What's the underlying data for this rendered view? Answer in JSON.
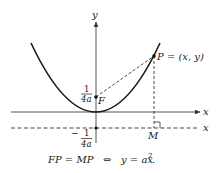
{
  "diagram": {
    "axes": {
      "x_label": "x",
      "y_label": "y",
      "directrix_label": "x"
    },
    "points": {
      "focus": {
        "name": "F",
        "y_value_num": "1",
        "y_value_den": "4a"
      },
      "point": {
        "label": "P = (x, y)"
      },
      "foot": {
        "name": "M"
      },
      "directrix_value": {
        "sign": "−",
        "num": "1",
        "den": "4a"
      }
    },
    "equation": {
      "left": "FP = MP",
      "iff": "⇔",
      "right_base": "y = ax",
      "right_exp": "2",
      "right_end": "."
    },
    "colors": {
      "ink": "#1a1a1a",
      "axis": "#555555"
    }
  }
}
